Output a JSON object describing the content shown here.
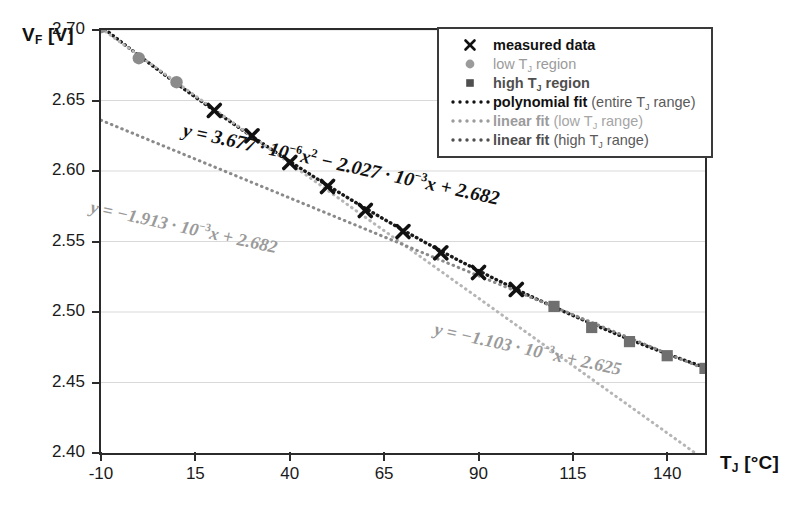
{
  "axes": {
    "y_title_main": "V",
    "y_title_sub": "F",
    "y_title_unit": " [V]",
    "x_title_main": "T",
    "x_title_sub": "J",
    "x_title_unit": " [°C]"
  },
  "legend": {
    "items": [
      {
        "key": "x-marker-icon",
        "text": "measured data",
        "style": "bold-dark"
      },
      {
        "key": "circle-marker-icon",
        "text": "low Tⱼ region",
        "style": "grey"
      },
      {
        "key": "square-marker-icon",
        "text": "high Tⱼ region",
        "style": "dark"
      },
      {
        "key": "dotted-line-icon",
        "text": "polynomial fit (entire Tⱼ range)",
        "style": "bold-dark",
        "bold_part": "polynomial fit",
        "rest": " (entire Tⱼ range)"
      },
      {
        "key": "dotted-line-icon",
        "text": "linear fit (low Tⱼ range)",
        "style": "grey",
        "bold_part": "linear fit",
        "rest": " (low Tⱼ range)"
      },
      {
        "key": "dotted-line-icon",
        "text": "linear fit (high Tⱼ range)",
        "style": "dark",
        "bold_part": "linear fit",
        "rest": " (high Tⱼ range)"
      }
    ]
  },
  "annotations": {
    "polynomial": "y = 3.677 · 10⁻⁶x² − 2.027 · 10⁻³x + 2.682",
    "linear_low": "y = −1.913 · 10⁻³x + 2.682",
    "linear_high": "y = −1.103 · 10⁻³x + 2.625"
  },
  "colors": {
    "frame": "#2b2b2b",
    "gridline": "#d9d9d9",
    "measured": "#111111",
    "low_region": "#8b8b8b",
    "high_region": "#6f6f6f",
    "poly_fit": "#1a1a1a",
    "linear_low_fit": "#b5b5b5",
    "linear_high_fit": "#8a8a8a"
  },
  "chart_data": {
    "type": "scatter",
    "title": "",
    "xlabel": "T_J [°C]",
    "ylabel": "V_F [V]",
    "xlim": [
      -10,
      150
    ],
    "ylim": [
      2.4,
      2.7
    ],
    "xticks": [
      -10,
      15,
      40,
      65,
      90,
      115,
      140
    ],
    "yticks": [
      2.4,
      2.45,
      2.5,
      2.55,
      2.6,
      2.65,
      2.7
    ],
    "grid": true,
    "legend_position": "top-right",
    "series": [
      {
        "name": "low T_J region",
        "marker": "circle",
        "x": [
          -10,
          0,
          10
        ],
        "y": [
          2.702,
          2.68,
          2.663
        ]
      },
      {
        "name": "measured data",
        "marker": "x",
        "x": [
          20,
          30,
          40,
          50,
          60,
          70,
          80,
          90,
          100
        ],
        "y": [
          2.643,
          2.625,
          2.606,
          2.589,
          2.572,
          2.557,
          2.542,
          2.528,
          2.516
        ]
      },
      {
        "name": "high T_J region",
        "marker": "square",
        "x": [
          110,
          120,
          130,
          140,
          150
        ],
        "y": [
          2.504,
          2.489,
          2.479,
          2.469,
          2.46
        ]
      }
    ],
    "fits": [
      {
        "name": "polynomial fit (entire T_J range)",
        "type": "quadratic",
        "a": 3.677e-06,
        "b": -0.002027,
        "c": 2.682,
        "equation": "y = 3.677 · 10⁻⁶x² − 2.027 · 10⁻³x + 2.682",
        "x_range": [
          -10,
          150
        ]
      },
      {
        "name": "linear fit (low T_J range)",
        "type": "linear",
        "slope": -0.001913,
        "intercept": 2.682,
        "equation": "y = −1.913 · 10⁻³x + 2.682",
        "x_range": [
          -10,
          150
        ]
      },
      {
        "name": "linear fit (high T_J range)",
        "type": "linear",
        "slope": -0.001103,
        "intercept": 2.625,
        "equation": "y = −1.103 · 10⁻³x + 2.625",
        "x_range": [
          -10,
          150
        ]
      }
    ]
  }
}
